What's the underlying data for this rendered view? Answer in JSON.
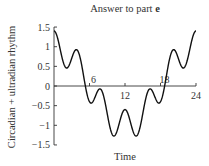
{
  "chart_data": {
    "type": "line",
    "title": "Answer to part e",
    "title_plain": "Answer to part ",
    "title_bold": "e",
    "xlabel": "Time",
    "ylabel": "Circadian + ultradian rhythm",
    "xlim": [
      0,
      24
    ],
    "ylim": [
      -1.5,
      1.5
    ],
    "x_ticks": [
      6,
      12,
      18,
      24
    ],
    "x_tick_labels": [
      "6",
      "12",
      "18",
      "24"
    ],
    "y_ticks": [
      1.5,
      1,
      0.5,
      0,
      -0.5,
      -1,
      -1.5
    ],
    "y_tick_labels": [
      "1.5",
      "1",
      "0.5",
      "0",
      "−0.5",
      "−1",
      "−1.5"
    ],
    "grid": false,
    "legend": null,
    "function": "cos(2πt/24) + 0.4·cos(2πt/4)",
    "series": [
      {
        "name": "Circadian + ultradian rhythm",
        "x": [
          0,
          1,
          2,
          3,
          4,
          5,
          6,
          7,
          8,
          9,
          10,
          11,
          12,
          13,
          14,
          15,
          16,
          17,
          18,
          19,
          20,
          21,
          22,
          23,
          24
        ],
        "values": [
          1.4,
          1.17,
          0.47,
          0.31,
          0.9,
          0.86,
          -0.4,
          -0.46,
          0.0,
          -0.71,
          -1.27,
          -1.17,
          -0.6,
          -1.17,
          -1.27,
          -0.71,
          0.0,
          -0.46,
          -0.4,
          0.86,
          0.9,
          0.31,
          0.47,
          1.17,
          1.4
        ]
      }
    ]
  }
}
